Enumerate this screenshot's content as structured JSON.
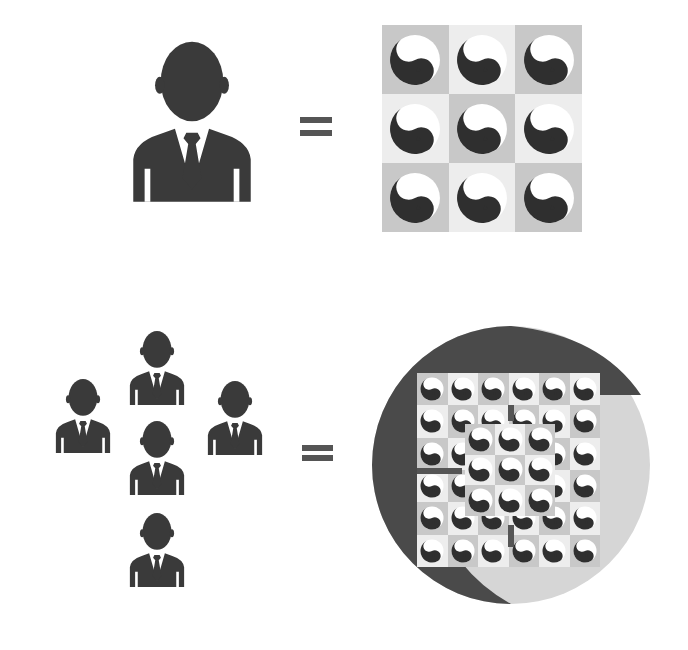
{
  "colors": {
    "figure": "#3a3a3a",
    "equals": "#555555",
    "tile_dark": "#c8c8c8",
    "tile_light": "#ededed",
    "circle_dark": "#4a4a4a",
    "circle_light": "#d6d6d6",
    "yin": "#2f2f2f",
    "yang": "#ffffff"
  },
  "top_row": {
    "left": {
      "icon": "person-icon",
      "count": 1
    },
    "operator": "=",
    "right": {
      "icon": "yin-yang-icon",
      "grid": [
        3,
        3
      ],
      "count": 9
    }
  },
  "bottom_row": {
    "left": {
      "icon": "person-icon",
      "count": 5,
      "arrangement": "cross"
    },
    "operator": "=",
    "right": {
      "icon": "yin-yang-icon",
      "outer_grid": [
        6,
        6
      ],
      "inner_grid": [
        3,
        3
      ],
      "container": "yin-yang-circle"
    }
  }
}
